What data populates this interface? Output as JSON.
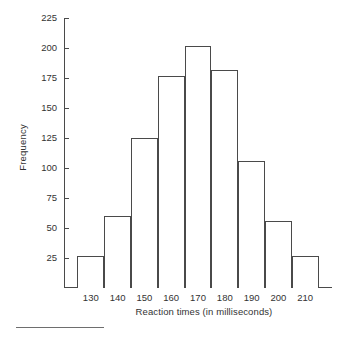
{
  "chart_data": {
    "type": "bar",
    "title": "",
    "subtitle": "",
    "xlabel": "Reaction times (in milliseconds)",
    "ylabel": "Frequency",
    "categories": [
      "130",
      "140",
      "150",
      "160",
      "170",
      "180",
      "190",
      "200",
      "210"
    ],
    "bin_edges": [
      125,
      135,
      145,
      155,
      165,
      175,
      185,
      195,
      205,
      215
    ],
    "values": [
      27,
      60,
      125,
      177,
      202,
      182,
      106,
      56,
      27
    ],
    "ylim": [
      0,
      225
    ],
    "yticks": [
      25,
      50,
      75,
      100,
      125,
      150,
      175,
      200,
      225
    ],
    "ytick_labels": [
      "25",
      "50",
      "75",
      "100",
      "125",
      "150",
      "175",
      "200",
      "225"
    ],
    "xtick_labels": [
      "130",
      "140",
      "150",
      "160",
      "170",
      "180",
      "190",
      "200",
      "210"
    ],
    "grid": false,
    "legend": null,
    "bar_fill_color": "#ffffff",
    "bar_edge_color": "#4a4a4a",
    "axis_color": "#4a4a4a",
    "text_color": "#333333",
    "background_color": "#ffffff"
  },
  "figure": {
    "bottom_rule_present": true
  }
}
